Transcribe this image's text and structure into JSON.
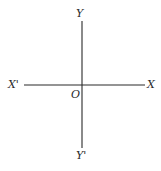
{
  "diagram": {
    "type": "cartesian-axes",
    "labels": {
      "y_positive": "Y",
      "y_negative": "Y'",
      "x_positive": "X",
      "x_negative": "X'",
      "origin": "O"
    },
    "colors": {
      "line": "#2a2a2a",
      "background": "#ffffff"
    }
  }
}
